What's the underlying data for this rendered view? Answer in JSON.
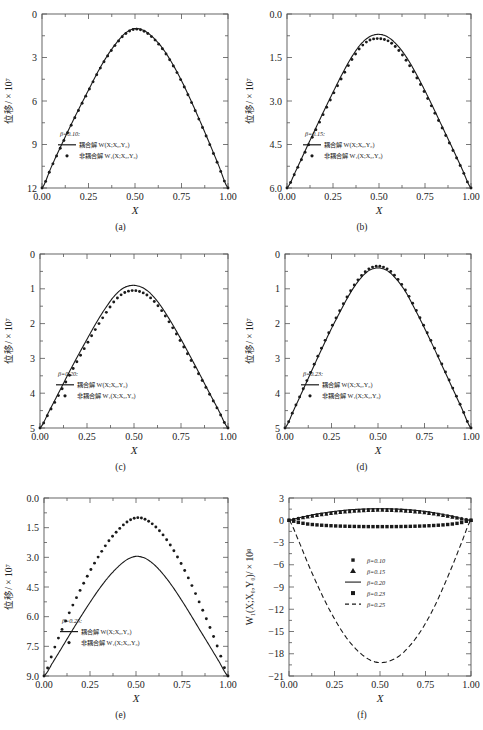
{
  "figure": {
    "type": "multi-panel-line-chart",
    "panels_total": 6,
    "background": "#ffffff",
    "line_color": "#1a1a1a"
  },
  "labels": {
    "x_axis": "X",
    "y_axis_displacement": "位移/ × 10",
    "y_axis_displacement_exp": "7",
    "y_axis_f": "W₁(X;X₀,Y₀)/ × 10",
    "y_axis_f_exp": "8",
    "legend_coupled": "耦合解",
    "legend_uncoupled": "非耦合解",
    "legend_coupled_sym": "W(X;X₀,Y₀)",
    "legend_uncoupled_sym": "W₁(X;X₀,Y₀)"
  },
  "captions": [
    "(a)",
    "(b)",
    "(c)",
    "(d)",
    "(e)",
    "(f)"
  ],
  "chart_data": [
    {
      "id": "a",
      "type": "line",
      "title": "",
      "caption": "(a)",
      "beta_label": "β=0.10:",
      "xlabel": "X",
      "ylabel": "位移/ × 10⁷",
      "xlim": [
        0.0,
        1.0
      ],
      "ylim": [
        0,
        12
      ],
      "xticks": [
        "0.00",
        "0.25",
        "0.50",
        "0.75",
        "1.00"
      ],
      "yticks": [
        "0",
        "3",
        "6",
        "9",
        "12"
      ],
      "grid": false,
      "legend_position": "lower-left",
      "series": [
        {
          "name": "耦合解 W(X;X₀,Y₀)",
          "style": "solid",
          "peak": 11.0,
          "x": [
            0,
            0.05,
            0.1,
            0.15,
            0.2,
            0.25,
            0.3,
            0.35,
            0.4,
            0.45,
            0.5,
            0.55,
            0.6,
            0.65,
            0.7,
            0.75,
            0.8,
            0.85,
            0.9,
            0.95,
            1.0
          ],
          "values": [
            0,
            1.45,
            2.85,
            4.2,
            5.5,
            6.75,
            8.0,
            9.1,
            10.0,
            10.7,
            11.0,
            10.85,
            10.35,
            9.6,
            8.6,
            7.4,
            6.05,
            4.6,
            3.1,
            1.55,
            0
          ]
        },
        {
          "name": "非耦合解 W₁(X;X₀,Y₀)",
          "style": "dots",
          "peak": 10.95,
          "x": [
            0,
            0.05,
            0.1,
            0.15,
            0.2,
            0.25,
            0.3,
            0.35,
            0.4,
            0.45,
            0.5,
            0.55,
            0.6,
            0.65,
            0.7,
            0.75,
            0.8,
            0.85,
            0.9,
            0.95,
            1.0
          ],
          "values": [
            0,
            1.42,
            2.8,
            4.15,
            5.45,
            6.7,
            7.95,
            9.05,
            9.95,
            10.65,
            10.95,
            10.8,
            10.3,
            9.55,
            8.55,
            7.35,
            6.0,
            4.55,
            3.05,
            1.5,
            0
          ]
        }
      ]
    },
    {
      "id": "b",
      "type": "line",
      "caption": "(b)",
      "beta_label": "β=0.15:",
      "xlabel": "X",
      "ylabel": "位移/ × 10⁷",
      "xlim": [
        0.0,
        1.0
      ],
      "ylim": [
        0.0,
        6.0
      ],
      "xticks": [
        "0.00",
        "0.25",
        "0.50",
        "0.75",
        "1.00"
      ],
      "yticks": [
        "0.0",
        "1.5",
        "3.0",
        "4.5",
        "6.0"
      ],
      "grid": false,
      "legend_position": "lower-left",
      "series": [
        {
          "name": "耦合解 W(X;X₀,Y₀)",
          "style": "solid",
          "peak": 5.3,
          "x": [
            0,
            0.05,
            0.1,
            0.15,
            0.2,
            0.25,
            0.3,
            0.35,
            0.4,
            0.45,
            0.5,
            0.55,
            0.6,
            0.65,
            0.7,
            0.75,
            0.8,
            0.85,
            0.9,
            0.95,
            1.0
          ],
          "values": [
            0,
            0.62,
            1.3,
            1.98,
            2.65,
            3.3,
            3.93,
            4.5,
            4.95,
            5.22,
            5.3,
            5.2,
            4.92,
            4.5,
            3.96,
            3.35,
            2.7,
            2.03,
            1.36,
            0.68,
            0
          ]
        },
        {
          "name": "非耦合解 W₁(X;X₀,Y₀)",
          "style": "dots",
          "peak": 5.15,
          "x": [
            0,
            0.05,
            0.1,
            0.15,
            0.2,
            0.25,
            0.3,
            0.35,
            0.4,
            0.45,
            0.5,
            0.55,
            0.6,
            0.65,
            0.7,
            0.75,
            0.8,
            0.85,
            0.9,
            0.95,
            1.0
          ],
          "values": [
            0,
            0.6,
            1.26,
            1.92,
            2.58,
            3.22,
            3.83,
            4.4,
            4.85,
            5.1,
            5.15,
            5.07,
            4.8,
            4.38,
            3.86,
            3.27,
            2.63,
            1.98,
            1.32,
            0.66,
            0
          ]
        }
      ]
    },
    {
      "id": "c",
      "type": "line",
      "caption": "(c)",
      "beta_label": "β=0.20:",
      "xlabel": "X",
      "ylabel": "位移/ × 10⁷",
      "xlim": [
        0.0,
        1.0
      ],
      "ylim": [
        0,
        5
      ],
      "xticks": [
        "0.00",
        "0.25",
        "0.50",
        "0.75",
        "1.00"
      ],
      "yticks": [
        "0",
        "1",
        "2",
        "3",
        "4",
        "5"
      ],
      "grid": false,
      "legend_position": "lower-left",
      "series": [
        {
          "name": "耦合解 W(X;X₀,Y₀)",
          "style": "solid",
          "peak": 4.1,
          "x": [
            0,
            0.05,
            0.1,
            0.15,
            0.2,
            0.25,
            0.3,
            0.35,
            0.4,
            0.45,
            0.5,
            0.55,
            0.6,
            0.65,
            0.7,
            0.75,
            0.8,
            0.85,
            0.9,
            0.95,
            1.0
          ],
          "values": [
            0,
            0.5,
            1.02,
            1.55,
            2.06,
            2.55,
            3.03,
            3.46,
            3.82,
            4.04,
            4.1,
            4.02,
            3.8,
            3.45,
            3.02,
            2.55,
            2.05,
            1.54,
            1.02,
            0.51,
            0
          ]
        },
        {
          "name": "非耦合解 W₁(X;X₀,Y₀)",
          "style": "dots",
          "peak": 3.95,
          "x": [
            0,
            0.05,
            0.1,
            0.15,
            0.2,
            0.25,
            0.3,
            0.35,
            0.4,
            0.45,
            0.5,
            0.55,
            0.6,
            0.65,
            0.7,
            0.75,
            0.8,
            0.85,
            0.9,
            0.95,
            1.0
          ],
          "values": [
            0,
            0.46,
            0.95,
            1.45,
            1.94,
            2.42,
            2.88,
            3.3,
            3.67,
            3.89,
            3.95,
            3.88,
            3.68,
            3.35,
            2.93,
            2.47,
            1.98,
            1.49,
            0.99,
            0.49,
            0
          ]
        }
      ]
    },
    {
      "id": "d",
      "type": "line",
      "caption": "(d)",
      "beta_label": "β=0.23:",
      "xlabel": "X",
      "ylabel": "位移/ × 10⁷",
      "xlim": [
        0.0,
        1.0
      ],
      "ylim": [
        0,
        5
      ],
      "xticks": [
        "0.00",
        "0.25",
        "0.50",
        "0.75",
        "1.00"
      ],
      "yticks": [
        "0",
        "1",
        "2",
        "3",
        "4",
        "5"
      ],
      "grid": false,
      "legend_position": "lower-left",
      "series": [
        {
          "name": "耦合解 W(X;X₀,Y₀)",
          "style": "solid",
          "peak": 4.6,
          "x": [
            0,
            0.05,
            0.1,
            0.15,
            0.2,
            0.25,
            0.3,
            0.35,
            0.4,
            0.45,
            0.5,
            0.55,
            0.6,
            0.65,
            0.7,
            0.75,
            0.8,
            0.85,
            0.9,
            0.95,
            1.0
          ],
          "values": [
            0,
            0.55,
            1.13,
            1.72,
            2.3,
            2.86,
            3.38,
            3.87,
            4.26,
            4.52,
            4.6,
            4.52,
            4.27,
            3.9,
            3.4,
            2.87,
            2.31,
            1.73,
            1.15,
            0.57,
            0
          ]
        },
        {
          "name": "非耦合解 W₁(X;X₀,Y₀)",
          "style": "dots",
          "peak": 4.65,
          "x": [
            0,
            0.05,
            0.1,
            0.15,
            0.2,
            0.25,
            0.3,
            0.35,
            0.4,
            0.45,
            0.5,
            0.55,
            0.6,
            0.65,
            0.7,
            0.75,
            0.8,
            0.85,
            0.9,
            0.95,
            1.0
          ],
          "values": [
            0,
            0.56,
            1.15,
            1.75,
            2.34,
            2.9,
            3.43,
            3.92,
            4.31,
            4.57,
            4.65,
            4.57,
            4.32,
            3.94,
            3.44,
            2.9,
            2.34,
            1.76,
            1.17,
            0.58,
            0
          ]
        }
      ]
    },
    {
      "id": "e",
      "type": "line",
      "caption": "(e)",
      "beta_label": "β=0.25:",
      "xlabel": "X",
      "ylabel": "位移/ × 10⁷",
      "xlim": [
        0.0,
        1.0
      ],
      "ylim": [
        0.0,
        9.0
      ],
      "xticks": [
        "0.00",
        "0.25",
        "0.50",
        "0.75",
        "1.00"
      ],
      "yticks": [
        "0.0",
        "1.5",
        "3.0",
        "4.5",
        "6.0",
        "7.5",
        "9.0"
      ],
      "grid": false,
      "legend_position": "lower-left",
      "series": [
        {
          "name": "耦合解 W(X;X₀,Y₀)",
          "style": "solid",
          "peak": 6.05,
          "x": [
            0,
            0.05,
            0.1,
            0.15,
            0.2,
            0.25,
            0.3,
            0.35,
            0.4,
            0.45,
            0.5,
            0.55,
            0.6,
            0.65,
            0.7,
            0.75,
            0.8,
            0.85,
            0.9,
            0.95,
            1.0
          ],
          "values": [
            0,
            0.72,
            1.48,
            2.25,
            3.0,
            3.72,
            4.4,
            5.0,
            5.5,
            5.88,
            6.05,
            5.95,
            5.62,
            5.12,
            4.5,
            3.8,
            3.05,
            2.28,
            1.52,
            0.75,
            0
          ]
        },
        {
          "name": "非耦合解 W₁(X;X₀,Y₀)",
          "style": "dots",
          "peak": 8.0,
          "x": [
            0,
            0.05,
            0.1,
            0.15,
            0.2,
            0.25,
            0.3,
            0.35,
            0.4,
            0.45,
            0.5,
            0.55,
            0.6,
            0.65,
            0.7,
            0.75,
            0.8,
            0.85,
            0.9,
            0.95,
            1.0
          ],
          "values": [
            0,
            1.25,
            2.4,
            3.45,
            4.4,
            5.3,
            6.1,
            6.8,
            7.35,
            7.78,
            8.0,
            7.92,
            7.6,
            7.1,
            6.42,
            5.6,
            4.65,
            3.6,
            2.5,
            1.3,
            0
          ]
        }
      ]
    },
    {
      "id": "f",
      "type": "line",
      "caption": "(f)",
      "xlabel": "X",
      "ylabel": "W₁(X;X₀,Y₀)/ × 10⁸",
      "xlim": [
        0.0,
        1.0
      ],
      "ylim": [
        -21,
        3
      ],
      "xticks": [
        "0.00",
        "0.25",
        "0.50",
        "0.75",
        "1.00"
      ],
      "yticks": [
        "3",
        "0",
        "-3",
        "-6",
        "-9",
        "-12",
        "-15",
        "-18",
        "-21"
      ],
      "grid": false,
      "legend_position": "center",
      "series": [
        {
          "name": "β=0.10",
          "style": "small-square",
          "marker": "square-small",
          "x": [
            0,
            0.05,
            0.1,
            0.15,
            0.2,
            0.25,
            0.3,
            0.35,
            0.4,
            0.45,
            0.5,
            0.55,
            0.6,
            0.65,
            0.7,
            0.75,
            0.8,
            0.85,
            0.9,
            0.95,
            1.0
          ],
          "values": [
            0,
            0.25,
            0.5,
            0.72,
            0.9,
            1.05,
            1.2,
            1.3,
            1.38,
            1.44,
            1.45,
            1.44,
            1.4,
            1.33,
            1.22,
            1.08,
            0.9,
            0.68,
            0.45,
            0.2,
            0
          ]
        },
        {
          "name": "β=0.15",
          "style": "triangle",
          "marker": "triangle",
          "x": [
            0,
            0.05,
            0.1,
            0.15,
            0.2,
            0.25,
            0.3,
            0.35,
            0.4,
            0.45,
            0.5,
            0.55,
            0.6,
            0.65,
            0.7,
            0.75,
            0.8,
            0.85,
            0.9,
            0.95,
            1.0
          ],
          "values": [
            0,
            0.22,
            0.45,
            0.65,
            0.82,
            0.98,
            1.1,
            1.2,
            1.28,
            1.33,
            1.35,
            1.33,
            1.3,
            1.22,
            1.12,
            0.99,
            0.83,
            0.63,
            0.42,
            0.19,
            0
          ]
        },
        {
          "name": "β=0.20",
          "style": "solid",
          "marker": "line",
          "x": [
            0,
            0.05,
            0.1,
            0.15,
            0.2,
            0.25,
            0.3,
            0.35,
            0.4,
            0.45,
            0.5,
            0.55,
            0.6,
            0.65,
            0.7,
            0.75,
            0.8,
            0.85,
            0.9,
            0.95,
            1.0
          ],
          "values": [
            0,
            0.3,
            0.58,
            0.82,
            1.02,
            1.2,
            1.33,
            1.44,
            1.5,
            1.54,
            1.55,
            1.54,
            1.5,
            1.43,
            1.32,
            1.18,
            1.0,
            0.77,
            0.52,
            0.24,
            0
          ]
        },
        {
          "name": "β=0.23",
          "style": "square",
          "marker": "square",
          "x": [
            0,
            0.05,
            0.1,
            0.15,
            0.2,
            0.25,
            0.3,
            0.35,
            0.4,
            0.45,
            0.5,
            0.55,
            0.6,
            0.65,
            0.7,
            0.75,
            0.8,
            0.85,
            0.9,
            0.95,
            1.0
          ],
          "values": [
            0,
            -0.28,
            -0.5,
            -0.62,
            -0.7,
            -0.76,
            -0.8,
            -0.83,
            -0.85,
            -0.86,
            -0.86,
            -0.86,
            -0.85,
            -0.83,
            -0.8,
            -0.76,
            -0.7,
            -0.62,
            -0.5,
            -0.3,
            0
          ]
        },
        {
          "name": "β=0.25",
          "style": "dashed",
          "marker": "dashed-line",
          "x": [
            0,
            0.05,
            0.1,
            0.15,
            0.2,
            0.25,
            0.3,
            0.35,
            0.4,
            0.45,
            0.5,
            0.55,
            0.6,
            0.65,
            0.7,
            0.75,
            0.8,
            0.85,
            0.9,
            0.95,
            1.0
          ],
          "values": [
            0,
            -2.6,
            -5.6,
            -8.4,
            -11.0,
            -13.3,
            -15.3,
            -16.9,
            -18.1,
            -18.9,
            -19.2,
            -19.0,
            -18.4,
            -17.3,
            -15.8,
            -13.9,
            -11.6,
            -8.9,
            -6.0,
            -2.9,
            0
          ]
        }
      ]
    }
  ]
}
